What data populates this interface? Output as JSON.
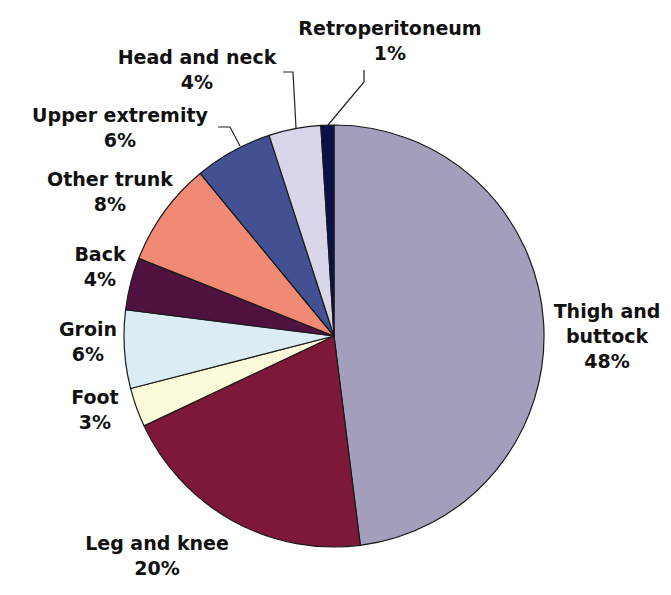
{
  "chart_data": {
    "type": "pie",
    "title": "",
    "start_angle_deg": 0,
    "direction": "clockwise",
    "slices": [
      {
        "label": "Thigh and buttock",
        "value": 48,
        "display": "48%",
        "color": "#a29ebc"
      },
      {
        "label": "Leg and knee",
        "value": 20,
        "display": "20%",
        "color": "#7e1838"
      },
      {
        "label": "Foot",
        "value": 3,
        "display": "3%",
        "color": "#fbfbdc"
      },
      {
        "label": "Groin",
        "value": 6,
        "display": "6%",
        "color": "#dcecf5"
      },
      {
        "label": "Back",
        "value": 4,
        "display": "4%",
        "color": "#4f1240"
      },
      {
        "label": "Other trunk",
        "value": 8,
        "display": "8%",
        "color": "#f08a74"
      },
      {
        "label": "Upper extremity",
        "value": 6,
        "display": "6%",
        "color": "#435092"
      },
      {
        "label": "Head and neck",
        "value": 4,
        "display": "4%",
        "color": "#d8d6e8"
      },
      {
        "label": "Retroperitoneum",
        "value": 1,
        "display": "1%",
        "color": "#0b0f4a"
      }
    ]
  },
  "labels": {
    "thigh": {
      "l1": "Thigh and",
      "l2": "buttock",
      "pct": "48%"
    },
    "leg": {
      "l1": "Leg and knee",
      "pct": "20%"
    },
    "foot": {
      "l1": "Foot",
      "pct": "3%"
    },
    "groin": {
      "l1": "Groin",
      "pct": "6%"
    },
    "back": {
      "l1": "Back",
      "pct": "4%"
    },
    "other": {
      "l1": "Other trunk",
      "pct": "8%"
    },
    "upper": {
      "l1": "Upper extremity",
      "pct": "6%"
    },
    "head": {
      "l1": "Head and neck",
      "pct": "4%"
    },
    "retro": {
      "l1": "Retroperitoneum",
      "pct": "1%"
    }
  }
}
